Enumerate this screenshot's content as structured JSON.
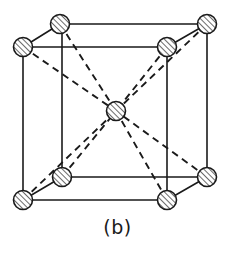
{
  "figure": {
    "caption": "(b)",
    "kind": "body-centered-cubic-unit-cell",
    "title": "",
    "colors": {
      "line": "#1a1a1a",
      "background": "#ffffff",
      "atom_fill": "#ffffff",
      "atom_hatch": "#1a1a1a",
      "caption": "#1a1a1a"
    },
    "style": {
      "solid_edge_width": 1.6,
      "dashed_edge_width": 1.9,
      "dash_pattern": "7 5",
      "atom_radius": 9.5,
      "atom_stroke_width": 1.6,
      "hatch_angle_deg": 45
    },
    "atoms": [
      {
        "name": "corner-front-top-left",
        "label": "corner",
        "x": 23,
        "y": 47
      },
      {
        "name": "corner-front-top-right",
        "label": "corner",
        "x": 167,
        "y": 47
      },
      {
        "name": "corner-front-bottom-left",
        "label": "corner",
        "x": 23,
        "y": 200
      },
      {
        "name": "corner-front-bottom-right",
        "label": "corner",
        "x": 167,
        "y": 200
      },
      {
        "name": "corner-back-top-left",
        "label": "corner",
        "x": 60,
        "y": 24
      },
      {
        "name": "corner-back-top-right",
        "label": "corner",
        "x": 207,
        "y": 24
      },
      {
        "name": "corner-back-bottom-left",
        "label": "corner",
        "x": 62,
        "y": 177
      },
      {
        "name": "corner-back-bottom-right",
        "label": "corner",
        "x": 207,
        "y": 177
      },
      {
        "name": "body-center",
        "label": "center",
        "x": 116,
        "y": 111
      }
    ],
    "solid_edges": [
      {
        "name": "edge-front-top",
        "x1": 23,
        "y1": 47,
        "x2": 167,
        "y2": 47
      },
      {
        "name": "edge-front-left",
        "x1": 23,
        "y1": 47,
        "x2": 23,
        "y2": 200
      },
      {
        "name": "edge-front-right",
        "x1": 167,
        "y1": 47,
        "x2": 167,
        "y2": 200
      },
      {
        "name": "edge-front-bottom",
        "x1": 23,
        "y1": 200,
        "x2": 167,
        "y2": 200
      },
      {
        "name": "edge-back-top",
        "x1": 60,
        "y1": 24,
        "x2": 207,
        "y2": 24
      },
      {
        "name": "edge-back-left",
        "x1": 62,
        "y1": 24,
        "x2": 62,
        "y2": 177
      },
      {
        "name": "edge-back-right",
        "x1": 207,
        "y1": 24,
        "x2": 207,
        "y2": 177
      },
      {
        "name": "edge-back-bottom",
        "x1": 62,
        "y1": 177,
        "x2": 207,
        "y2": 177
      },
      {
        "name": "edge-depth-top-left",
        "x1": 23,
        "y1": 47,
        "x2": 60,
        "y2": 24
      },
      {
        "name": "edge-depth-top-right",
        "x1": 167,
        "y1": 47,
        "x2": 207,
        "y2": 24
      },
      {
        "name": "edge-depth-bottom-left",
        "x1": 23,
        "y1": 200,
        "x2": 62,
        "y2": 177
      },
      {
        "name": "edge-depth-bottom-right",
        "x1": 167,
        "y1": 200,
        "x2": 207,
        "y2": 177
      }
    ],
    "dashed_diagonals": [
      {
        "name": "diagonal-front-top-left-to-center",
        "x1": 23,
        "y1": 47,
        "x2": 116,
        "y2": 111
      },
      {
        "name": "diagonal-front-top-right-to-center",
        "x1": 167,
        "y1": 47,
        "x2": 116,
        "y2": 111
      },
      {
        "name": "diagonal-front-bottom-left-to-center",
        "x1": 23,
        "y1": 200,
        "x2": 116,
        "y2": 111
      },
      {
        "name": "diagonal-front-bottom-right-to-center",
        "x1": 167,
        "y1": 200,
        "x2": 116,
        "y2": 111
      },
      {
        "name": "diagonal-back-top-left-to-center",
        "x1": 60,
        "y1": 24,
        "x2": 116,
        "y2": 111
      },
      {
        "name": "diagonal-back-top-right-to-center",
        "x1": 207,
        "y1": 24,
        "x2": 116,
        "y2": 111
      },
      {
        "name": "diagonal-back-bottom-left-to-center",
        "x1": 62,
        "y1": 177,
        "x2": 116,
        "y2": 111
      },
      {
        "name": "diagonal-back-bottom-right-to-center",
        "x1": 207,
        "y1": 177,
        "x2": 116,
        "y2": 111
      }
    ]
  }
}
